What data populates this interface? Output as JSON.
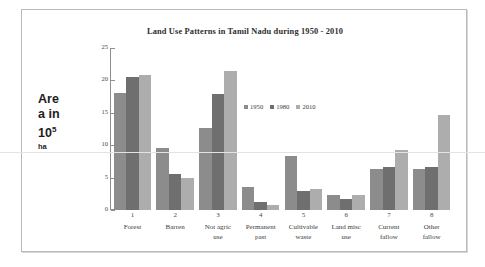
{
  "chart_data": {
    "type": "bar",
    "title": "Land Use Patterns in Tamil Nadu during 1950 - 2010",
    "xlabel": "",
    "ylabel": "Area in 10⁵ ha",
    "ylabel_lines": [
      "Are",
      "a in",
      "10",
      "ha"
    ],
    "ylabel_exponent": "5",
    "ylim": [
      0,
      25
    ],
    "yticks": [
      0,
      5,
      10,
      15,
      20,
      25
    ],
    "ytick_labels": [
      "0",
      "5",
      "10",
      "15",
      "20",
      "25"
    ],
    "grid": false,
    "legend_position": "inside-upper-center",
    "categories": [
      "Forest",
      "Barren",
      "Not agric use",
      "Permanent past",
      "Cultivable waste",
      "Land misc use",
      "Current fallow",
      "Other fallow"
    ],
    "category_numbers": [
      "1",
      "2",
      "3",
      "4",
      "5",
      "6",
      "7",
      "8"
    ],
    "category_label_lines": [
      [
        "Forest"
      ],
      [
        "Barren"
      ],
      [
        "Not agric",
        "use"
      ],
      [
        "Permanent",
        "past"
      ],
      [
        "Cultivable",
        "waste"
      ],
      [
        "Land misc",
        "use"
      ],
      [
        "Current",
        "fallow"
      ],
      [
        "Other",
        "fallow"
      ]
    ],
    "series": [
      {
        "name": "1950",
        "color": "#8c8c8c",
        "values": [
          18.1,
          9.6,
          12.7,
          3.6,
          8.4,
          2.3,
          6.3,
          6.3
        ]
      },
      {
        "name": "1980",
        "color": "#6f6f6f",
        "values": [
          20.6,
          5.5,
          17.9,
          1.3,
          2.9,
          1.7,
          6.6,
          6.6
        ]
      },
      {
        "name": "2010",
        "color": "#adadad",
        "values": [
          20.8,
          4.9,
          21.4,
          0.8,
          3.3,
          2.3,
          9.2,
          14.6
        ]
      }
    ]
  }
}
